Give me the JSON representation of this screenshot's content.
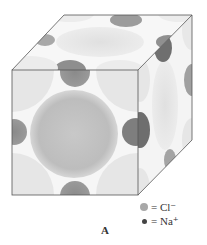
{
  "figure": {
    "caption": "A",
    "colors": {
      "cl_ion": "#b4b4b4",
      "na_ion": "#7a7a7a",
      "edge": "#555555"
    }
  },
  "legend": {
    "items": [
      {
        "symbol": "large-light-circle",
        "eq": "=",
        "label": "Cl⁻"
      },
      {
        "symbol": "small-dark-circle",
        "eq": "=",
        "label": "Na⁺"
      }
    ]
  }
}
